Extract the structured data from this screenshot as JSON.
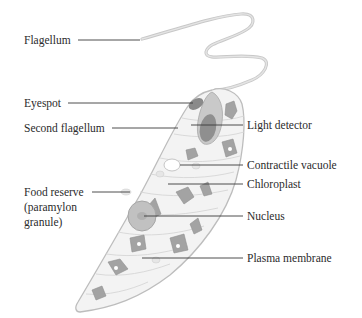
{
  "diagram": {
    "colors": {
      "background": "#ffffff",
      "text": "#2b2b2b",
      "leader_line": "#3a3a3a",
      "cell_outline": "#bdbdbd",
      "cell_fill": "#f3f3f3",
      "organelle_fill": "#9a9a9a",
      "nucleus_fill": "#b5b5b5",
      "flagellum": "#c8c8c8"
    },
    "labels": [
      {
        "id": "flagellum",
        "text": "Flagellum",
        "side": "left"
      },
      {
        "id": "eyespot",
        "text": "Eyespot",
        "side": "left"
      },
      {
        "id": "second-flagellum",
        "text": "Second flagellum",
        "side": "left"
      },
      {
        "id": "light-detector",
        "text": "Light detector",
        "side": "right"
      },
      {
        "id": "contractile-vacuole",
        "text": "Contractile vacuole",
        "side": "right"
      },
      {
        "id": "chloroplast",
        "text": "Chloroplast",
        "side": "right"
      },
      {
        "id": "food-reserve",
        "text": "Food reserve (paramylon granule)",
        "side": "left"
      },
      {
        "id": "nucleus",
        "text": "Nucleus",
        "side": "right"
      },
      {
        "id": "plasma-membrane",
        "text": "Plasma membrane",
        "side": "right"
      }
    ]
  }
}
